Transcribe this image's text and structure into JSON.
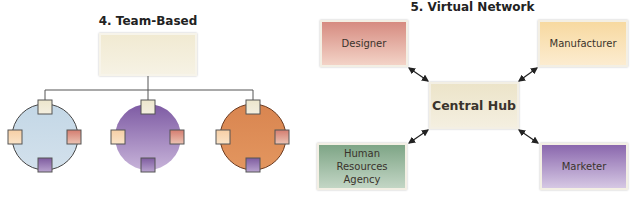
{
  "team_based": {
    "title": "4. Team-Based",
    "top_box_label": "",
    "teams": [
      {
        "fill": "#c9dbe8",
        "members": [
          "#f0e9d3",
          "#f7d7b3",
          "#d99a8a",
          "#8c6fa6"
        ]
      },
      {
        "fill": "#8f6ab0",
        "members": [
          "#f0e9d3",
          "#f7d7b3",
          "#d99a8a",
          "#8c6fa6"
        ]
      },
      {
        "fill": "#db8a55",
        "members": [
          "#f0e9d3",
          "#f7d7b3",
          "#d99a8a",
          "#8c6fa6"
        ]
      }
    ]
  },
  "virtual_network": {
    "title": "5. Virtual Network",
    "hub": {
      "label": "Central Hub",
      "color": "#efe8d2"
    },
    "nodes": [
      {
        "label": "Designer",
        "color": "#d99a8e"
      },
      {
        "label": "Manufacturer",
        "color": "#f8dfa8"
      },
      {
        "label": "Human Resources Agency",
        "color": "#8fb094"
      },
      {
        "label": "Marketer",
        "color": "#9a7bb8"
      }
    ]
  }
}
